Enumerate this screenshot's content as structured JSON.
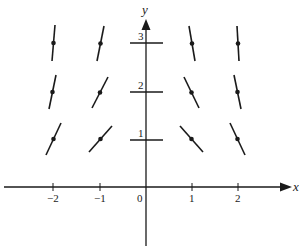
{
  "colors": {
    "stroke": "#1a1a1a",
    "background": "#ffffff"
  },
  "axes": {
    "x_label": "x",
    "y_label": "y",
    "origin_label": "0",
    "x_ticks": [
      {
        "value": -2,
        "label": "−2"
      },
      {
        "value": -1,
        "label": "−1"
      },
      {
        "value": 1,
        "label": "1"
      },
      {
        "value": 2,
        "label": "2"
      }
    ],
    "y_ticks": [
      {
        "value": 1,
        "label": "1"
      },
      {
        "value": 2,
        "label": "2"
      },
      {
        "value": 3,
        "label": "3"
      }
    ]
  },
  "pixel_mapping": {
    "origin_px": [
      146,
      187
    ],
    "px_per_x_unit": 46,
    "px_per_y_unit": 48
  },
  "segments": [
    {
      "x": -2,
      "y": 3,
      "p1": [
        55,
        25
      ],
      "p2": [
        52,
        61
      ],
      "dot": true
    },
    {
      "x": -1,
      "y": 3,
      "p1": [
        104,
        26
      ],
      "p2": [
        97,
        61
      ],
      "dot": true
    },
    {
      "x": -2,
      "y": 2,
      "p1": [
        56,
        75
      ],
      "p2": [
        49,
        109
      ],
      "dot": true
    },
    {
      "x": -1,
      "y": 2,
      "p1": [
        108,
        77
      ],
      "p2": [
        92,
        108
      ],
      "dot": true
    },
    {
      "x": -2,
      "y": 1,
      "p1": [
        61,
        123
      ],
      "p2": [
        46,
        155
      ],
      "dot": true
    },
    {
      "x": -1,
      "y": 1,
      "p1": [
        112,
        126
      ],
      "p2": [
        89,
        152
      ],
      "dot": true
    },
    {
      "x": 0,
      "y": 3,
      "p1": [
        130,
        43
      ],
      "p2": [
        163,
        43
      ],
      "dot": false
    },
    {
      "x": 0,
      "y": 2,
      "p1": [
        130,
        92
      ],
      "p2": [
        163,
        92
      ],
      "dot": false
    },
    {
      "x": 0,
      "y": 1,
      "p1": [
        130,
        140
      ],
      "p2": [
        163,
        140
      ],
      "dot": false
    },
    {
      "x": 1,
      "y": 3,
      "p1": [
        189,
        26
      ],
      "p2": [
        195,
        61
      ],
      "dot": true
    },
    {
      "x": 2,
      "y": 3,
      "p1": [
        237,
        26
      ],
      "p2": [
        239,
        61
      ],
      "dot": true
    },
    {
      "x": 1,
      "y": 2,
      "p1": [
        184,
        77
      ],
      "p2": [
        199,
        108
      ],
      "dot": true
    },
    {
      "x": 2,
      "y": 2,
      "p1": [
        234,
        75
      ],
      "p2": [
        241,
        109
      ],
      "dot": true
    },
    {
      "x": 1,
      "y": 1,
      "p1": [
        180,
        126
      ],
      "p2": [
        203,
        152
      ],
      "dot": true
    },
    {
      "x": 2,
      "y": 1,
      "p1": [
        230,
        123
      ],
      "p2": [
        245,
        155
      ],
      "dot": true
    }
  ]
}
